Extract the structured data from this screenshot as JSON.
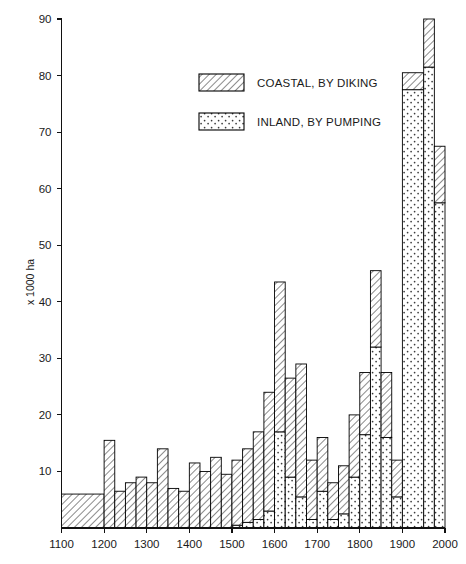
{
  "figure": {
    "name": "land-reclamation-chart",
    "ylabel": "x 1000 ha",
    "xlabel": ""
  },
  "legend": {
    "items": [
      {
        "key": "coastal",
        "label": "COASTAL, BY DIKING",
        "pattern": "diagonal-hatch"
      },
      {
        "key": "inland",
        "label": "INLAND, BY PUMPING",
        "pattern": "dotted"
      }
    ]
  },
  "axes": {
    "y_ticks": [
      "10",
      "20",
      "30",
      "40",
      "50",
      "60",
      "70",
      "80",
      "90"
    ],
    "x_ticks": [
      "1100",
      "1200",
      "1300",
      "1400",
      "1500",
      "1600",
      "1700",
      "1800",
      "1900",
      "2000"
    ]
  },
  "chart_data": {
    "type": "bar",
    "title": "",
    "xlabel": "",
    "ylabel": "x 1000 ha",
    "xlim": [
      1100,
      2000
    ],
    "ylim": [
      0,
      90
    ],
    "grid": false,
    "legend_position": "upper-center",
    "note": "Stacked histogram of land reclaimed per period; bars span variable-width year intervals.",
    "series": [
      {
        "name": "COASTAL, BY DIKING",
        "key": "coastal",
        "pattern": "diagonal-hatch"
      },
      {
        "name": "INLAND, BY PUMPING",
        "key": "inland",
        "pattern": "dotted"
      }
    ],
    "bins": [
      {
        "start": 1100,
        "end": 1200,
        "coastal": 6.0,
        "inland": 0.0,
        "total": 6.0
      },
      {
        "start": 1200,
        "end": 1225,
        "coastal": 15.5,
        "inland": 0.0,
        "total": 15.5
      },
      {
        "start": 1225,
        "end": 1250,
        "coastal": 6.5,
        "inland": 0.0,
        "total": 6.5
      },
      {
        "start": 1250,
        "end": 1275,
        "coastal": 8.0,
        "inland": 0.0,
        "total": 8.0
      },
      {
        "start": 1275,
        "end": 1300,
        "coastal": 9.0,
        "inland": 0.0,
        "total": 9.0
      },
      {
        "start": 1300,
        "end": 1325,
        "coastal": 8.0,
        "inland": 0.0,
        "total": 8.0
      },
      {
        "start": 1325,
        "end": 1350,
        "coastal": 14.0,
        "inland": 0.0,
        "total": 14.0
      },
      {
        "start": 1350,
        "end": 1375,
        "coastal": 7.0,
        "inland": 0.0,
        "total": 7.0
      },
      {
        "start": 1375,
        "end": 1400,
        "coastal": 6.5,
        "inland": 0.0,
        "total": 6.5
      },
      {
        "start": 1400,
        "end": 1425,
        "coastal": 11.5,
        "inland": 0.0,
        "total": 11.5
      },
      {
        "start": 1425,
        "end": 1450,
        "coastal": 10.0,
        "inland": 0.0,
        "total": 10.0
      },
      {
        "start": 1450,
        "end": 1475,
        "coastal": 12.5,
        "inland": 0.0,
        "total": 12.5
      },
      {
        "start": 1475,
        "end": 1500,
        "coastal": 9.5,
        "inland": 0.0,
        "total": 9.5
      },
      {
        "start": 1500,
        "end": 1525,
        "coastal": 11.5,
        "inland": 0.5,
        "total": 12.0
      },
      {
        "start": 1525,
        "end": 1550,
        "coastal": 13.0,
        "inland": 1.0,
        "total": 14.0
      },
      {
        "start": 1550,
        "end": 1575,
        "coastal": 15.5,
        "inland": 1.5,
        "total": 17.0
      },
      {
        "start": 1575,
        "end": 1600,
        "coastal": 21.0,
        "inland": 3.0,
        "total": 24.0
      },
      {
        "start": 1600,
        "end": 1625,
        "coastal": 26.5,
        "inland": 17.0,
        "total": 43.5
      },
      {
        "start": 1625,
        "end": 1650,
        "coastal": 17.5,
        "inland": 9.0,
        "total": 26.5
      },
      {
        "start": 1650,
        "end": 1675,
        "coastal": 23.5,
        "inland": 5.5,
        "total": 29.0
      },
      {
        "start": 1675,
        "end": 1700,
        "coastal": 10.5,
        "inland": 1.5,
        "total": 12.0
      },
      {
        "start": 1700,
        "end": 1725,
        "coastal": 9.5,
        "inland": 6.5,
        "total": 16.0
      },
      {
        "start": 1725,
        "end": 1750,
        "coastal": 6.5,
        "inland": 1.5,
        "total": 8.0
      },
      {
        "start": 1750,
        "end": 1775,
        "coastal": 8.5,
        "inland": 2.5,
        "total": 11.0
      },
      {
        "start": 1775,
        "end": 1800,
        "coastal": 11.0,
        "inland": 9.0,
        "total": 20.0
      },
      {
        "start": 1800,
        "end": 1825,
        "coastal": 11.0,
        "inland": 16.5,
        "total": 27.5
      },
      {
        "start": 1825,
        "end": 1850,
        "coastal": 13.5,
        "inland": 32.0,
        "total": 45.5
      },
      {
        "start": 1850,
        "end": 1875,
        "coastal": 11.5,
        "inland": 16.0,
        "total": 27.5
      },
      {
        "start": 1875,
        "end": 1900,
        "coastal": 6.5,
        "inland": 5.5,
        "total": 12.0
      },
      {
        "start": 1900,
        "end": 1950,
        "coastal": 3.0,
        "inland": 77.5,
        "total": 80.5
      },
      {
        "start": 1950,
        "end": 1975,
        "coastal": 8.5,
        "inland": 81.5,
        "total": 90.0
      },
      {
        "start": 1975,
        "end": 2000,
        "coastal": 10.0,
        "inland": 57.5,
        "total": 67.5
      }
    ]
  }
}
